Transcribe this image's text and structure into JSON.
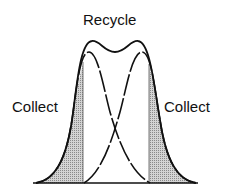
{
  "diagram": {
    "labels": {
      "top": "Recycle",
      "left": "Collect",
      "right": "Collect"
    },
    "colors": {
      "line": "#111111",
      "shade": "#b8b8b8",
      "background": "#ffffff"
    }
  }
}
